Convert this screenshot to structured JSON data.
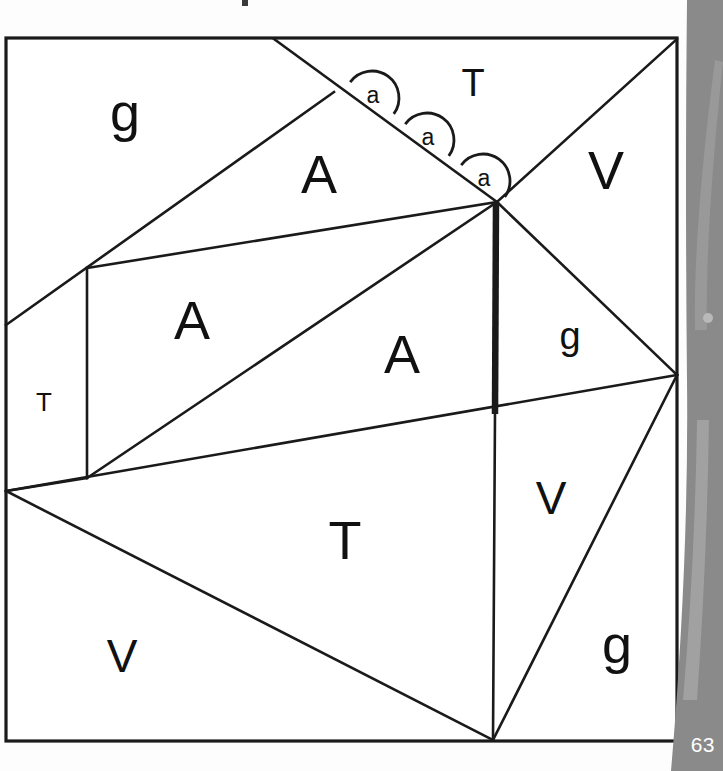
{
  "figure": {
    "page_number": "63",
    "background_color": "#ffffff",
    "line_color": "#1a1a1a",
    "page_edge_color": "#8a8a8a",
    "frame": {
      "x": 6,
      "y": 38,
      "width": 671,
      "height": 703
    },
    "region_labels": [
      {
        "id": "g-top-left",
        "text": "g",
        "x": 125,
        "y": 117,
        "size": "xl"
      },
      {
        "id": "T-top",
        "text": "T",
        "x": 473,
        "y": 86,
        "size": "md"
      },
      {
        "id": "A-upper",
        "text": "A",
        "x": 319,
        "y": 179,
        "size": "xl"
      },
      {
        "id": "V-upper-right",
        "text": "V",
        "x": 606,
        "y": 175,
        "size": "xl"
      },
      {
        "id": "A-mid-left",
        "text": "A",
        "x": 192,
        "y": 325,
        "size": "xl"
      },
      {
        "id": "A-center",
        "text": "A",
        "x": 402,
        "y": 359,
        "size": "xl"
      },
      {
        "id": "g-right",
        "text": "g",
        "x": 570,
        "y": 339,
        "size": "md"
      },
      {
        "id": "T-left",
        "text": "T",
        "x": 44,
        "y": 404,
        "size": "sm"
      },
      {
        "id": "V-lower-right",
        "text": "V",
        "x": 551,
        "y": 502,
        "size": "lg"
      },
      {
        "id": "T-bottom",
        "text": "T",
        "x": 345,
        "y": 545,
        "size": "xl"
      },
      {
        "id": "V-bottom-left",
        "text": "V",
        "x": 122,
        "y": 660,
        "size": "lg"
      },
      {
        "id": "g-bottom-right",
        "text": "g",
        "x": 617,
        "y": 649,
        "size": "xl"
      }
    ],
    "angle_markers": [
      {
        "id": "angle-1",
        "label": "a",
        "cx": 372,
        "cy": 98,
        "lx": 373,
        "ly": 97
      },
      {
        "id": "angle-2",
        "label": "a",
        "cx": 427,
        "cy": 140,
        "lx": 428,
        "ly": 139
      },
      {
        "id": "angle-3",
        "label": "a",
        "cx": 483,
        "cy": 181,
        "lx": 484,
        "ly": 180
      }
    ],
    "edges": [
      {
        "id": "edge-topborder-to-cross",
        "x1": 274,
        "y1": 39,
        "x2": 497,
        "y2": 202
      },
      {
        "id": "edge-cross-to-leftborder",
        "x1": 334,
        "y1": 92,
        "x2": 6,
        "y2": 325
      },
      {
        "id": "edge-apex-to-topright",
        "x1": 497,
        "y1": 202,
        "x2": 677,
        "y2": 39
      },
      {
        "id": "edge-apex-to-rightnode",
        "x1": 497,
        "y1": 202,
        "x2": 677,
        "y2": 375
      },
      {
        "id": "edge-apex-to-midleft",
        "x1": 497,
        "y1": 202,
        "x2": 87,
        "y2": 268
      },
      {
        "id": "edge-apex-to-lowleft",
        "x1": 497,
        "y1": 202,
        "x2": 87,
        "y2": 478
      },
      {
        "id": "edge-midleft-vertical",
        "x1": 87,
        "y1": 268,
        "x2": 87,
        "y2": 478
      },
      {
        "id": "edge-lowleft-to-leftborder",
        "x1": 87,
        "y1": 478,
        "x2": 6,
        "y2": 491
      },
      {
        "id": "edge-crossbar-left-right",
        "x1": 6,
        "y1": 491,
        "x2": 677,
        "y2": 375
      },
      {
        "id": "edge-leftborder-to-bottom",
        "x1": 6,
        "y1": 491,
        "x2": 493,
        "y2": 740
      },
      {
        "id": "edge-rightnode-to-bottom",
        "x1": 677,
        "y1": 375,
        "x2": 493,
        "y2": 740
      },
      {
        "id": "edge-apex-vertical-thin",
        "x1": 495,
        "y1": 413,
        "x2": 493,
        "y2": 740
      }
    ],
    "thick_edges": [
      {
        "id": "edge-apex-vertical-thick",
        "x1": 496,
        "y1": 202,
        "x2": 495,
        "y2": 414
      }
    ]
  }
}
